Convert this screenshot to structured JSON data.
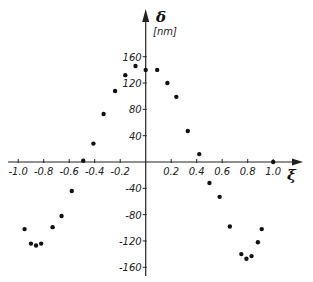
{
  "chart_data": {
    "type": "scatter",
    "title": "",
    "xlabel": "ξ",
    "ylabel": "δ",
    "yunit": "[nm]",
    "xlim": [
      -1.0,
      1.0
    ],
    "ylim": [
      -160,
      160
    ],
    "grid": false,
    "legend": null,
    "x_ticks": [
      -1.0,
      -0.8,
      -0.6,
      -0.4,
      -0.2,
      0.2,
      0.4,
      0.6,
      0.8,
      1.0
    ],
    "x_tick_labels": [
      "-1.0",
      "-0.8",
      "-0.6",
      "-0.4",
      "-0.2",
      "0.2",
      "0.4",
      "0.6",
      "0.8",
      "1.0"
    ],
    "y_ticks": [
      160,
      120,
      80,
      40,
      -40,
      -80,
      -120,
      -160
    ],
    "y_tick_labels": [
      "160",
      "120",
      "80",
      "40",
      "-40",
      "-80",
      "-120",
      "-160"
    ],
    "series": [
      {
        "name": "measured deflection",
        "color": "#111111",
        "points": [
          [
            -0.95,
            -102
          ],
          [
            -0.9,
            -124
          ],
          [
            -0.86,
            -127
          ],
          [
            -0.82,
            -124
          ],
          [
            -0.73,
            -99
          ],
          [
            -0.66,
            -82
          ],
          [
            -0.58,
            -44
          ],
          [
            -0.49,
            2
          ],
          [
            -0.41,
            28
          ],
          [
            -0.33,
            73
          ],
          [
            -0.24,
            108
          ],
          [
            -0.16,
            132
          ],
          [
            -0.08,
            146
          ],
          [
            0.0,
            140
          ],
          [
            0.09,
            140
          ],
          [
            0.17,
            120
          ],
          [
            0.24,
            99
          ],
          [
            0.33,
            47
          ],
          [
            0.42,
            12
          ],
          [
            0.5,
            -32
          ],
          [
            0.58,
            -53
          ],
          [
            0.66,
            -98
          ],
          [
            0.75,
            -140
          ],
          [
            0.79,
            -147
          ],
          [
            0.83,
            -143
          ],
          [
            0.88,
            -122
          ],
          [
            0.91,
            -102
          ],
          [
            1.0,
            0
          ]
        ]
      }
    ]
  },
  "layout": {
    "origin_x": 145.7,
    "origin_y": 162,
    "px_per_x": 127.5,
    "px_per_y": 0.658
  }
}
